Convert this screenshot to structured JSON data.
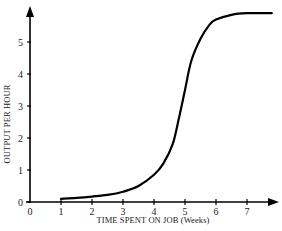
{
  "chart_data": {
    "type": "line",
    "title": "",
    "xlabel": "TIME SPENT ON JOB (Weeks)",
    "ylabel": "OUTPUT PER HOUR",
    "x_ticks": [
      "0",
      "1",
      "2",
      "3",
      "4",
      "5",
      "6",
      "7"
    ],
    "y_ticks": [
      "0",
      "1",
      "2",
      "3",
      "4",
      "5"
    ],
    "xlim": [
      0,
      8
    ],
    "ylim": [
      0,
      6
    ],
    "grid": false,
    "legend": null,
    "series": [
      {
        "name": "Learning curve",
        "x": [
          1.0,
          1.5,
          2.0,
          2.5,
          3.0,
          3.5,
          4.0,
          4.3,
          4.6,
          4.8,
          5.0,
          5.2,
          5.5,
          5.8,
          6.0,
          6.5,
          7.0,
          7.8
        ],
        "y": [
          0.1,
          0.13,
          0.17,
          0.22,
          0.32,
          0.5,
          0.85,
          1.2,
          1.8,
          2.6,
          3.5,
          4.4,
          5.1,
          5.55,
          5.7,
          5.85,
          5.9,
          5.9
        ]
      }
    ],
    "color": "#000000"
  }
}
